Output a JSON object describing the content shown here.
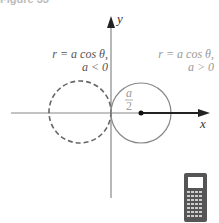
{
  "figure": {
    "title": "Figure 33",
    "axes": {
      "x_label": "x",
      "y_label": "y"
    },
    "left_curve": {
      "equation": "r = a cos θ,",
      "condition": "a < 0",
      "style": "dashed"
    },
    "right_curve": {
      "equation": "r = a cos θ,",
      "condition": "a > 0",
      "style": "solid"
    },
    "radius_label": {
      "numerator": "a",
      "denominator": "2"
    },
    "calculator_icon": "graphing-calculator-icon"
  }
}
